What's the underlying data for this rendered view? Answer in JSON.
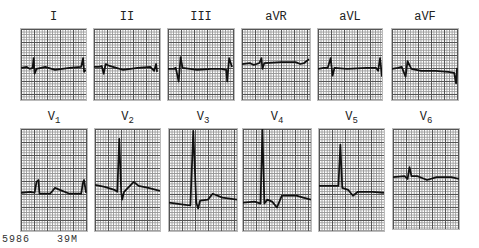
{
  "leads_top": [
    {
      "name": "I",
      "x": 20,
      "y": 28,
      "w": 67,
      "h": 73,
      "base": 40,
      "trace": "M0,40 L6,39 L9,41 L12,40 L13,30 L14,46 L16,41 L25,39 L35,42 L50,40 L62,39 L64,30 L65,44 L67,42"
    },
    {
      "name": "II",
      "x": 93,
      "y": 28,
      "w": 68,
      "h": 73,
      "base": 39,
      "trace": "M0,39 L5,39 L8,38 L10,46 L12,36 L16,38 L30,42 L45,40 L58,39 L62,43 L64,36 L65,44"
    },
    {
      "name": "III",
      "x": 167,
      "y": 28,
      "w": 68,
      "h": 73,
      "base": 41,
      "trace": "M0,41 L6,41 L8,40 L11,54 L13,29 L15,40 L30,42 L45,41 L55,41 L60,42 L61,54 L63,30 L66,39"
    },
    {
      "name": "aVR",
      "x": 241,
      "y": 28,
      "w": 70,
      "h": 73,
      "base": 34,
      "trace": "M0,36 L8,35 L12,37 L18,35 L20,30 L21,41 L23,35 L40,34 L55,34 L60,36 L64,35 L69,31"
    },
    {
      "name": "aVL",
      "x": 317,
      "y": 28,
      "w": 66,
      "h": 73,
      "base": 40,
      "trace": "M0,41 L6,40 L10,40 L13,30 L15,48 L17,40 L30,41 L50,40 L60,40 L62,43 L64,30 L66,49"
    },
    {
      "name": "aVF",
      "x": 391,
      "y": 28,
      "w": 68,
      "h": 73,
      "base": 40,
      "trace": "M0,41 L6,40 L10,39 L14,49 L16,33 L20,41 L30,43 L45,43 L58,44 L64,45 L66,56 L67,40"
    }
  ],
  "leads_bottom": [
    {
      "name": "V",
      "sub": "1",
      "x": 20,
      "y": 128,
      "w": 68,
      "h": 104,
      "trace": "M0,65 L10,64 L14,65 L16,54 L18,52 L19,66 L30,66 L35,60 L40,62 L50,66 L62,66 L64,54 L65,52 L67,65"
    },
    {
      "name": "V",
      "sub": "2",
      "x": 94,
      "y": 128,
      "w": 67,
      "h": 104,
      "trace": "M0,57 L10,59 L20,62 L23,64 L25,10 L27,64 L28,72 L30,64 L38,56 L40,54 L45,58 L55,60 L67,63"
    },
    {
      "name": "V",
      "sub": "3",
      "x": 168,
      "y": 128,
      "w": 70,
      "h": 104,
      "trace": "M0,75 L15,77 L22,78 L25,2 L28,75 L30,81 L32,73 L40,72 L45,66 L55,70 L70,72"
    },
    {
      "name": "V",
      "sub": "4",
      "x": 242,
      "y": 128,
      "w": 70,
      "h": 104,
      "trace": "M0,75 L12,74 L18,76 L20,0 L22,76 L25,72 L30,74 L35,80 L40,68 L55,68 L62,70 L70,72"
    },
    {
      "name": "V",
      "sub": "5",
      "x": 318,
      "y": 128,
      "w": 67,
      "h": 104,
      "trace": "M0,58 L15,58 L20,58 L22,16 L24,60 L30,62 L35,68 L40,64 L55,64 L67,65"
    },
    {
      "name": "V",
      "sub": "6",
      "x": 392,
      "y": 128,
      "w": 68,
      "h": 102,
      "trace": "M0,49 L12,48 L15,51 L17,39 L19,48 L25,48 L30,50 L35,52 L45,49 L60,49 L68,51"
    }
  ],
  "labels_top_y": 10,
  "labels_bottom_y": 110,
  "footer": {
    "id": "5986",
    "patient": "39M"
  },
  "colors": {
    "trace": "#111111",
    "grid_major": "#555555",
    "grid_minor": "#999999"
  }
}
